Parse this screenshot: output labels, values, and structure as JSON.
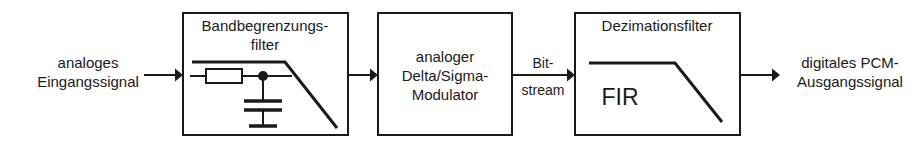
{
  "diagram": {
    "stroke_color": "#1a1a1a",
    "background_color": "#ffffff",
    "input_label": {
      "line1": "analoges",
      "line2": "Eingangssignal"
    },
    "output_label": {
      "line1": "digitales PCM-",
      "line2": "Ausgangssignal"
    },
    "interstage_label": {
      "line1": "Bit-",
      "line2": "stream"
    },
    "blocks": [
      {
        "id": "bandlimit-filter",
        "title_line1": "Bandbegrenzungs-",
        "title_line2": "filter",
        "contents": "rc-lowpass-schematic-with-response-curve"
      },
      {
        "id": "delta-sigma-modulator",
        "title_line1": "analoger",
        "title_line2": "Delta/Sigma-",
        "title_line3": "Modulator",
        "contents": "text-only"
      },
      {
        "id": "decimation-filter",
        "title_line1": "Dezimationsfilter",
        "inner_label": "FIR",
        "contents": "fir-response-curve"
      }
    ]
  }
}
